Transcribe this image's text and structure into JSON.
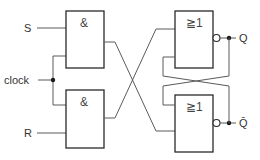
{
  "diagram": {
    "inputs": {
      "s_label": "S",
      "clock_label": "clock",
      "r_label": "R"
    },
    "outputs": {
      "q_label": "Q",
      "qbar_label": "Q̄"
    },
    "gates": {
      "and_top_symbol": "&",
      "and_bottom_symbol": "&",
      "nor_top_symbol": "≧1",
      "nor_bottom_symbol": "≧1"
    },
    "colors": {
      "wire": "#5a5a5a",
      "gate_outline": "#2a2a2a",
      "junction": "#1a1a1a",
      "background": "#ffffff"
    }
  }
}
